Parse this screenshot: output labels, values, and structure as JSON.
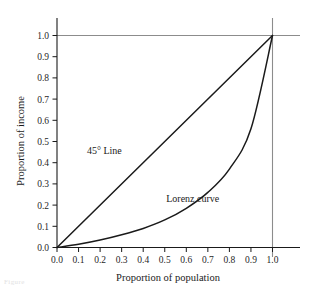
{
  "figure": {
    "background_color": "#ffffff",
    "axis_color": "#1a1a1a",
    "reference_line_color": "#8c8c8c",
    "curve_color": "#1a1a1a",
    "bottom_artifact_text": "Figure"
  },
  "chart_data": {
    "type": "line",
    "title": "",
    "xlabel": "Proportion of population",
    "ylabel": "Proportion of income",
    "xlim": [
      0.0,
      1.0
    ],
    "ylim": [
      0.0,
      1.0
    ],
    "grid": false,
    "legend_position": "inline-annotation",
    "xticks": [
      "0.0",
      "0.1",
      "0.2",
      "0.3",
      "0.4",
      "0.5",
      "0.6",
      "0.7",
      "0.8",
      "0.9",
      "1.0"
    ],
    "yticks": [
      "0.0",
      "0.1",
      "0.2",
      "0.3",
      "0.4",
      "0.5",
      "0.6",
      "0.7",
      "0.8",
      "0.9",
      "1.0"
    ],
    "xtick_values": [
      0.0,
      0.1,
      0.2,
      0.3,
      0.4,
      0.5,
      0.6,
      0.7,
      0.8,
      0.9,
      1.0
    ],
    "ytick_values": [
      0.0,
      0.1,
      0.2,
      0.3,
      0.4,
      0.5,
      0.6,
      0.7,
      0.8,
      0.9,
      1.0
    ],
    "reference_lines": [
      {
        "name": "income-1.0-gridline",
        "orientation": "horizontal",
        "value": 1.0,
        "color": "#8c8c8c"
      },
      {
        "name": "population-1.0-gridline",
        "orientation": "vertical",
        "value": 1.0,
        "color": "#8c8c8c"
      }
    ],
    "series": [
      {
        "name": "45° Line",
        "label": "45° Line",
        "kind": "equality-line",
        "x": [
          0.0,
          1.0
        ],
        "values": [
          0.0,
          1.0
        ],
        "annotation": {
          "text": "45° Line",
          "x": 0.22,
          "y": 0.44
        }
      },
      {
        "name": "Lorenz curve",
        "label": "Lorenz curve",
        "kind": "lorenz-curve",
        "x": [
          0.0,
          0.1,
          0.2,
          0.3,
          0.4,
          0.5,
          0.6,
          0.7,
          0.8,
          0.9,
          1.0
        ],
        "values": [
          0.0,
          0.015,
          0.035,
          0.06,
          0.09,
          0.13,
          0.185,
          0.26,
          0.37,
          0.56,
          1.0
        ],
        "annotation": {
          "text": "Lorenz curve",
          "x": 0.63,
          "y": 0.215
        }
      }
    ]
  }
}
